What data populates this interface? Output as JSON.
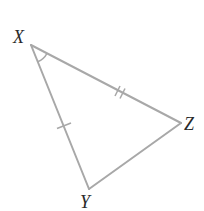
{
  "diagram": {
    "type": "triangle",
    "vertices": [
      {
        "name": "X",
        "label": "X",
        "x": 31,
        "y": 45
      },
      {
        "name": "Y",
        "label": "Y",
        "x": 89,
        "y": 189
      },
      {
        "name": "Z",
        "label": "Z",
        "x": 181,
        "y": 123
      }
    ],
    "edges": [
      {
        "from": "X",
        "to": "Z",
        "tick_marks": 2
      },
      {
        "from": "X",
        "to": "Y",
        "tick_marks": 1
      },
      {
        "from": "Y",
        "to": "Z",
        "tick_marks": 0
      }
    ],
    "angle_marks": [
      {
        "vertex": "X",
        "arcs": 1
      }
    ],
    "colors": {
      "line": "#a8a8a8",
      "label": "#2a2a2a",
      "background": "#ffffff"
    }
  }
}
